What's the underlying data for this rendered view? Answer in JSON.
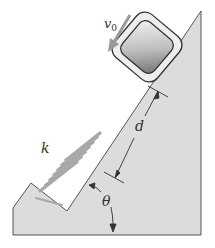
{
  "diagram": {
    "labels": {
      "velocity": "v",
      "velocity_sub": "0",
      "distance": "d",
      "spring_constant": "k",
      "angle": "θ"
    },
    "colors": {
      "incline_fill": "#dcdcdc",
      "outline": "#555555",
      "spring": "#a8a8a8",
      "arrow_velocity": "#9a9a9a",
      "block_outer": "#e6e6e6",
      "block_inner_light": "#f2f2f2",
      "block_inner_dark": "#7a7a7a"
    }
  }
}
